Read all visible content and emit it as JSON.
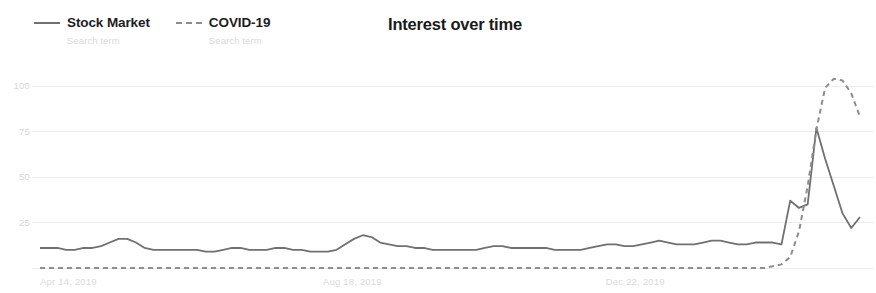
{
  "chart_data": {
    "type": "line",
    "title": "Interest over time",
    "xlabel": "",
    "ylabel": "",
    "ylim": [
      0,
      105
    ],
    "yticks": [
      25,
      50,
      75,
      100
    ],
    "grid": true,
    "legend_position": "top-left",
    "xtick_labels": [
      "Apr 14, 2019",
      "Aug 18, 2019",
      "Dec 22, 2019"
    ],
    "xtick_positions": [
      0,
      0.345,
      0.69
    ],
    "series": [
      {
        "name": "Stock Market",
        "sublabel": "Search term",
        "style": "solid",
        "color": "#707070",
        "values": [
          11,
          11,
          11,
          10,
          10,
          11,
          11,
          12,
          14,
          16,
          16,
          14,
          11,
          10,
          10,
          10,
          10,
          10,
          10,
          9,
          9,
          10,
          11,
          11,
          10,
          10,
          10,
          11,
          11,
          10,
          10,
          9,
          9,
          9,
          10,
          13,
          16,
          18,
          17,
          14,
          13,
          12,
          12,
          11,
          11,
          10,
          10,
          10,
          10,
          10,
          10,
          11,
          12,
          12,
          11,
          11,
          11,
          11,
          11,
          10,
          10,
          10,
          10,
          11,
          12,
          13,
          13,
          12,
          12,
          13,
          14,
          15,
          14,
          13,
          13,
          13,
          14,
          15,
          15,
          14,
          13,
          13,
          14,
          14,
          14,
          13,
          37,
          33,
          35,
          77,
          60,
          45,
          30,
          22,
          28
        ]
      },
      {
        "name": "COVID-19",
        "sublabel": "Search term",
        "style": "dashed",
        "color": "#8d8d8d",
        "values": [
          0,
          0,
          0,
          0,
          0,
          0,
          0,
          0,
          0,
          0,
          0,
          0,
          0,
          0,
          0,
          0,
          0,
          0,
          0,
          0,
          0,
          0,
          0,
          0,
          0,
          0,
          0,
          0,
          0,
          0,
          0,
          0,
          0,
          0,
          0,
          0,
          0,
          0,
          0,
          0,
          0,
          0,
          0,
          0,
          0,
          0,
          0,
          0,
          0,
          0,
          0,
          0,
          0,
          0,
          0,
          0,
          0,
          0,
          0,
          0,
          0,
          0,
          0,
          0,
          0,
          0,
          0,
          0,
          0,
          0,
          0,
          0,
          0,
          0,
          0,
          0,
          0,
          0,
          0,
          0,
          0,
          0,
          0,
          0,
          1,
          2,
          6,
          20,
          45,
          76,
          99,
          104,
          103,
          96,
          83
        ]
      }
    ]
  },
  "colors": {
    "title": "#1a1a1a",
    "legend_label": "#1d1d1d",
    "legend_sub": "#d9d9d9",
    "tick": "#d9d9d9",
    "grid": "#ececec",
    "series_solid": "#707070",
    "series_dashed": "#8d8d8d"
  }
}
